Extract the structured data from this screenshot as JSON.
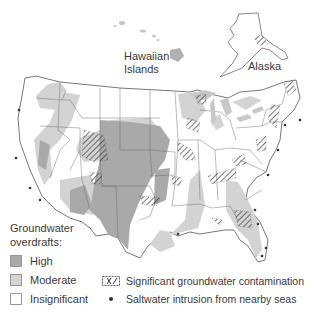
{
  "map": {
    "title": "Groundwater overdrafts and contamination in the United States",
    "labels": {
      "hawaii": [
        "Hawaiian",
        "Islands"
      ],
      "alaska": "Alaska"
    }
  },
  "legend": {
    "title_line1": "Groundwater",
    "title_line2": "overdrafts:",
    "items": [
      {
        "label": "High",
        "color": "#a9a9a9"
      },
      {
        "label": "Moderate",
        "color": "#d3d3d3"
      },
      {
        "label": "Insignificant",
        "color": "#ffffff"
      }
    ],
    "symbols": [
      {
        "icon": "hatched-contamination-icon",
        "label": "Significant groundwater contamination"
      },
      {
        "icon": "dot-icon",
        "label": "Saltwater intrusion from nearby seas"
      }
    ]
  },
  "colors": {
    "high": "#a9a9a9",
    "moderate": "#d3d3d3",
    "insignificant": "#ffffff",
    "border": "#555555"
  }
}
